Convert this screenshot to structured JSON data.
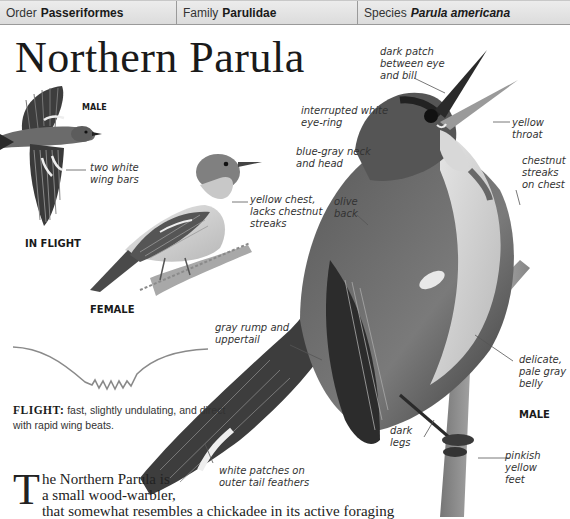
{
  "header": {
    "order": {
      "label": "Order",
      "value": "Passeriformes"
    },
    "family": {
      "label": "Family",
      "value": "Parulidae"
    },
    "species": {
      "label": "Species",
      "value": "Parula americana"
    }
  },
  "title": "Northern Parula",
  "illustrations": {
    "in_flight": {
      "sex_caption": "MALE",
      "view_caption": "IN FLIGHT",
      "labels": [
        "two white\nwing bars"
      ]
    },
    "female": {
      "caption": "FEMALE",
      "labels": [
        "yellow chest,\nlacks chestnut\nstreaks"
      ]
    },
    "male_perched": {
      "caption": "MALE",
      "labels": {
        "dark_patch": "dark patch\nbetween eye\nand bill",
        "eye_ring": "interrupted white\neye-ring",
        "yellow_throat": "yellow\nthroat",
        "neck_head": "blue-gray neck\nand head",
        "chestnut": "chestnut\nstreaks\non chest",
        "olive_back": "olive\nback",
        "rump": "gray rump and\nuppertail",
        "belly": "delicate,\npale gray\nbelly",
        "legs": "dark\nlegs",
        "feet": "pinkish\nyellow\nfeet",
        "tail": "white patches on\nouter tail feathers"
      }
    }
  },
  "flight": {
    "label": "FLIGHT:",
    "description": "fast, slightly undulating, and direct with rapid wing beats."
  },
  "body_text": {
    "drop_cap": "T",
    "line1": "he Northern Parula is",
    "line2": "a small wood-warbler,",
    "line3": "that somewhat resembles a chickadee in its active foraging"
  },
  "colors": {
    "header_bg": "#e4e4e4",
    "header_border": "#9a9a9a",
    "text": "#231f20",
    "leader_line": "#555555",
    "flight_path": "#8a8a8a"
  }
}
